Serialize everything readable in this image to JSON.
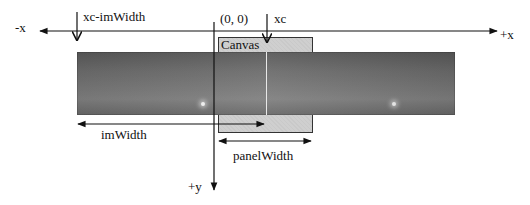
{
  "diagram": {
    "type": "coordinate-layout",
    "axes": {
      "x_negative_label": "-x",
      "x_positive_label": "+x",
      "y_positive_label": "+y",
      "origin_label": "(0, 0)"
    },
    "markers": {
      "xc_label": "xc",
      "xc_minus_imwidth_label": "xc-imWidth"
    },
    "regions": {
      "canvas_label": "Canvas"
    },
    "dimensions": {
      "imwidth_label": "imWidth",
      "panelwidth_label": "panelWidth"
    },
    "colors": {
      "canvas_fill": "#cfcfcf",
      "image_strip": "#707070",
      "lines": "#111111"
    }
  }
}
